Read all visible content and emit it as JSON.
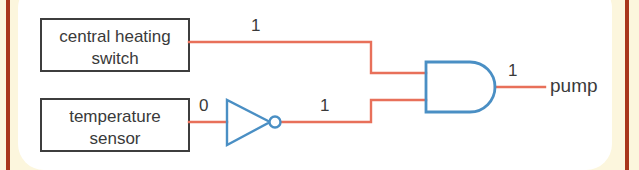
{
  "figure": {
    "background_color": "#fcf6dd",
    "panel_color": "#ffffff",
    "rule_color": "#a8361b",
    "wire_color": "#e8705a",
    "gate_color": "#4a8fc4",
    "box_border_color": "#3d3d3d",
    "text_color": "#3a3a3a"
  },
  "inputs": [
    {
      "id": "central-heating-switch",
      "line1": "central heating",
      "line2": "switch",
      "signal_value": "1"
    },
    {
      "id": "temperature-sensor",
      "line1": "temperature",
      "line2": "sensor",
      "signal_value": "0"
    }
  ],
  "gates": [
    {
      "id": "not-gate",
      "type": "NOT",
      "input_value": "0",
      "output_value": "1"
    },
    {
      "id": "and-gate",
      "type": "AND",
      "input_values": [
        "1",
        "1"
      ],
      "output_value": "1"
    }
  ],
  "output": {
    "id": "pump",
    "label": "pump",
    "signal_value": "1"
  },
  "signal_labels": {
    "top_wire": "1",
    "sensor_wire": "0",
    "not_output_wire": "1",
    "gate_output_wire": "1"
  }
}
